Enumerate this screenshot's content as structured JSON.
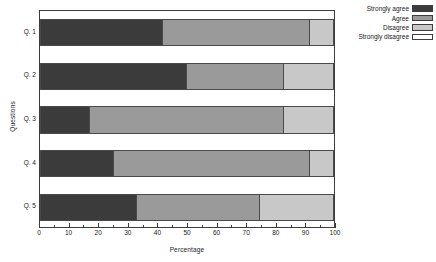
{
  "chart_data": {
    "type": "bar",
    "orientation": "horizontal",
    "stacked": true,
    "title": "",
    "xlabel": "Percentage",
    "ylabel": "Questions",
    "xlim": [
      0,
      100
    ],
    "xticks": [
      0,
      10,
      20,
      30,
      40,
      50,
      60,
      70,
      80,
      90,
      100
    ],
    "xtick_labels": [
      "0",
      "10",
      "20",
      "30",
      "40",
      "50",
      "60",
      "70",
      "80",
      "90",
      "100"
    ],
    "minor_ticks": true,
    "grid": false,
    "legend_position": "top-right",
    "categories": [
      "Q. 1",
      "Q. 2",
      "Q. 3",
      "Q. 4",
      "Q. 5"
    ],
    "series": [
      {
        "name": "Strongly agree",
        "color": "#3b3b3b",
        "values": [
          42,
          50,
          17,
          25,
          33
        ]
      },
      {
        "name": "Agree",
        "color": "#9a9a9a",
        "values": [
          50,
          33,
          66,
          67,
          42
        ]
      },
      {
        "name": "Disagree",
        "color": "#c8c8c8",
        "values": [
          8,
          17,
          17,
          8,
          25
        ]
      },
      {
        "name": "Strongly disagree",
        "color": "#ffffff",
        "values": [
          0,
          0,
          0,
          0,
          0
        ]
      }
    ],
    "cumulative_boundaries": [
      [
        42,
        92,
        100
      ],
      [
        50,
        83,
        100
      ],
      [
        17,
        83,
        100
      ],
      [
        25,
        92,
        100
      ],
      [
        33,
        75,
        100
      ]
    ]
  },
  "legend": {
    "items": [
      {
        "label": "Strongly agree",
        "color": "#3b3b3b"
      },
      {
        "label": "Agree",
        "color": "#9a9a9a"
      },
      {
        "label": "Disagree",
        "color": "#c8c8c8"
      },
      {
        "label": "Strongly disagree",
        "color": "#ffffff"
      }
    ]
  }
}
